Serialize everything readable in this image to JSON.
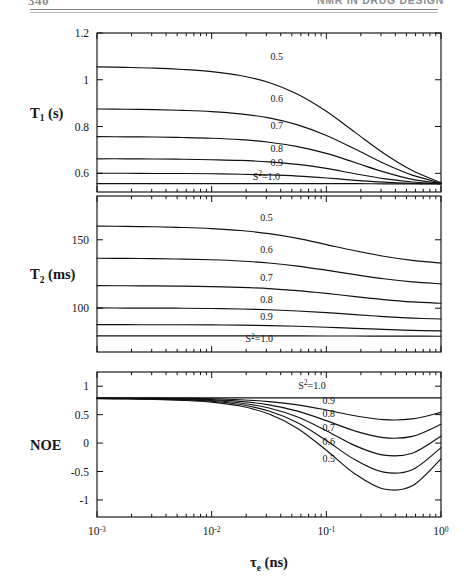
{
  "header": {
    "folio": "340",
    "running_head": "NMR IN DRUG DESIGN"
  },
  "figure": {
    "xaxis_title_main": "τ",
    "xaxis_title_sub": "e",
    "xaxis_title_unit": " (ns)",
    "xtick_labels": [
      "10-3",
      "10-2",
      "10-1",
      "100"
    ],
    "xtick_mantissa": [
      "10",
      "10",
      "10",
      "10"
    ],
    "xtick_exponent": [
      "-3",
      "-2",
      "-1",
      "0"
    ],
    "annotation_s2": "S",
    "annotation_s2_sup": "2",
    "annotation_s2_val": "=1.0"
  },
  "chart_data": [
    {
      "type": "line",
      "panel": "top",
      "ylabel": "T1 (s)",
      "ylabel_main": "T",
      "ylabel_sub": "1",
      "ylabel_unit": " (s)",
      "xlabel": "tau_e (ns)",
      "xscale": "log",
      "xlim": [
        0.001,
        1.0
      ],
      "ylim": [
        0.52,
        1.2
      ],
      "yticks": [
        1.2,
        1.0,
        0.8,
        0.6
      ],
      "ytick_labels": [
        "1.2",
        "1",
        "0.8",
        "0.6"
      ],
      "grid": false,
      "legend": "inline-curve-labels",
      "x": [
        0.001,
        0.00178,
        0.00316,
        0.00562,
        0.01,
        0.0178,
        0.0316,
        0.0562,
        0.1,
        0.178,
        0.316,
        0.562,
        1.0
      ],
      "series": [
        {
          "name": "0.5",
          "label": "0.5",
          "values": [
            1.055,
            1.053,
            1.05,
            1.044,
            1.035,
            1.018,
            0.988,
            0.938,
            0.865,
            0.775,
            0.686,
            0.612,
            0.56
          ]
        },
        {
          "name": "0.6",
          "label": "0.6",
          "values": [
            0.875,
            0.874,
            0.872,
            0.869,
            0.864,
            0.854,
            0.837,
            0.807,
            0.762,
            0.704,
            0.643,
            0.592,
            0.558
          ]
        },
        {
          "name": "0.7",
          "label": "0.7",
          "values": [
            0.757,
            0.756,
            0.755,
            0.753,
            0.75,
            0.744,
            0.733,
            0.714,
            0.685,
            0.646,
            0.606,
            0.574,
            0.557
          ]
        },
        {
          "name": "0.8",
          "label": "0.8",
          "values": [
            0.662,
            0.662,
            0.661,
            0.66,
            0.658,
            0.655,
            0.649,
            0.638,
            0.621,
            0.598,
            0.577,
            0.563,
            0.556
          ]
        },
        {
          "name": "0.9",
          "label": "0.9",
          "values": [
            0.6,
            0.6,
            0.599,
            0.599,
            0.598,
            0.596,
            0.593,
            0.588,
            0.58,
            0.57,
            0.562,
            0.557,
            0.555
          ]
        },
        {
          "name": "S2=1.0",
          "label": "S2=1.0",
          "values": [
            0.556,
            0.556,
            0.556,
            0.556,
            0.556,
            0.556,
            0.556,
            0.556,
            0.556,
            0.556,
            0.555,
            0.555,
            0.555
          ]
        }
      ],
      "curve_label_positions": [
        {
          "name": "0.5",
          "x": 0.037,
          "y": 1.085
        },
        {
          "name": "0.6",
          "x": 0.037,
          "y": 0.905
        },
        {
          "name": "0.7",
          "x": 0.037,
          "y": 0.788
        },
        {
          "name": "0.8",
          "x": 0.037,
          "y": 0.693
        },
        {
          "name": "0.9",
          "x": 0.037,
          "y": 0.631
        },
        {
          "name": "S2=1.0",
          "x": 0.03,
          "y": 0.573
        }
      ],
      "convergence_note": "all curves converge near 0.555 s at tau_e = 1 ns"
    },
    {
      "type": "line",
      "panel": "middle",
      "ylabel": "T2 (ms)",
      "ylabel_main": "T",
      "ylabel_sub": "2",
      "ylabel_unit": " (ms)",
      "xlabel": "tau_e (ns)",
      "xscale": "log",
      "xlim": [
        0.001,
        1.0
      ],
      "ylim": [
        68,
        182
      ],
      "yticks": [
        150,
        100
      ],
      "ytick_labels": [
        "150",
        "100"
      ],
      "grid": false,
      "legend": "inline-curve-labels",
      "x": [
        0.001,
        0.00178,
        0.00316,
        0.00562,
        0.01,
        0.0178,
        0.0316,
        0.0562,
        0.1,
        0.178,
        0.316,
        0.562,
        1.0
      ],
      "series": [
        {
          "name": "0.5",
          "label": "0.5",
          "values": [
            160.0,
            159.8,
            159.5,
            159.0,
            158.2,
            156.8,
            154.5,
            151.0,
            146.5,
            142.0,
            138.0,
            135.0,
            133.0
          ]
        },
        {
          "name": "0.6",
          "label": "0.6",
          "values": [
            136.5,
            136.4,
            136.2,
            135.9,
            135.4,
            134.5,
            133.0,
            130.8,
            127.8,
            124.5,
            121.5,
            119.2,
            117.8
          ]
        },
        {
          "name": "0.7",
          "label": "0.7",
          "values": [
            116.5,
            116.4,
            116.3,
            116.1,
            115.8,
            115.2,
            114.3,
            112.8,
            110.8,
            108.5,
            106.3,
            104.6,
            103.6
          ]
        },
        {
          "name": "0.8",
          "label": "0.8",
          "values": [
            100.2,
            100.1,
            100.1,
            100.0,
            99.8,
            99.4,
            98.9,
            98.0,
            96.8,
            95.3,
            93.9,
            92.8,
            92.1
          ]
        },
        {
          "name": "0.9",
          "label": "0.9",
          "values": [
            88.0,
            88.0,
            87.9,
            87.9,
            87.8,
            87.6,
            87.3,
            86.8,
            86.1,
            85.3,
            84.5,
            83.8,
            83.4
          ]
        },
        {
          "name": "S2=1.0",
          "label": "S2=1.0",
          "values": [
            79.8,
            79.8,
            79.8,
            79.8,
            79.8,
            79.8,
            79.8,
            79.8,
            79.7,
            79.7,
            79.6,
            79.6,
            79.5
          ]
        }
      ],
      "curve_label_positions": [
        {
          "name": "0.5",
          "x": 0.03,
          "y": 163.5
        },
        {
          "name": "0.6",
          "x": 0.03,
          "y": 140.0
        },
        {
          "name": "0.7",
          "x": 0.03,
          "y": 120.0
        },
        {
          "name": "0.8",
          "x": 0.03,
          "y": 103.5
        },
        {
          "name": "0.9",
          "x": 0.03,
          "y": 91.3
        },
        {
          "name": "S2=1.0",
          "x": 0.026,
          "y": 75.0
        }
      ]
    },
    {
      "type": "line",
      "panel": "bottom",
      "ylabel": "NOE",
      "xlabel": "tau_e (ns)",
      "xscale": "log",
      "xlim": [
        0.001,
        1.0
      ],
      "ylim": [
        -1.3,
        1.25
      ],
      "yticks": [
        1.0,
        0.5,
        0.0,
        -0.5,
        -1.0
      ],
      "ytick_labels": [
        "1",
        "0.5",
        "0",
        "-0.5",
        "-1"
      ],
      "grid": false,
      "legend": "inline-curve-labels",
      "x": [
        0.001,
        0.00178,
        0.00316,
        0.00562,
        0.01,
        0.0178,
        0.0316,
        0.0562,
        0.1,
        0.178,
        0.316,
        0.562,
        1.0
      ],
      "series": [
        {
          "name": "S2=1.0",
          "label": "S2=1.0",
          "values": [
            0.795,
            0.795,
            0.795,
            0.795,
            0.795,
            0.795,
            0.795,
            0.795,
            0.795,
            0.795,
            0.795,
            0.795,
            0.795
          ]
        },
        {
          "name": "0.9",
          "label": "0.9",
          "values": [
            0.793,
            0.792,
            0.79,
            0.786,
            0.779,
            0.762,
            0.73,
            0.672,
            0.582,
            0.48,
            0.412,
            0.425,
            0.54
          ]
        },
        {
          "name": "0.8",
          "label": "0.8",
          "values": [
            0.79,
            0.788,
            0.785,
            0.778,
            0.764,
            0.733,
            0.672,
            0.562,
            0.395,
            0.212,
            0.095,
            0.118,
            0.33
          ]
        },
        {
          "name": "0.7",
          "label": "0.7",
          "values": [
            0.787,
            0.784,
            0.779,
            0.769,
            0.749,
            0.705,
            0.617,
            0.458,
            0.218,
            -0.045,
            -0.212,
            -0.178,
            0.122
          ]
        },
        {
          "name": "0.6",
          "label": "0.6",
          "values": [
            0.784,
            0.78,
            0.774,
            0.761,
            0.735,
            0.678,
            0.563,
            0.357,
            0.045,
            -0.295,
            -0.512,
            -0.468,
            -0.08
          ]
        },
        {
          "name": "0.5",
          "label": "0.5",
          "values": [
            0.781,
            0.776,
            0.768,
            0.752,
            0.721,
            0.651,
            0.51,
            0.258,
            -0.125,
            -0.542,
            -0.808,
            -0.752,
            -0.278
          ]
        }
      ],
      "curve_label_positions": [
        {
          "name": "S2=1.0",
          "x": 0.075,
          "y": 0.955
        },
        {
          "name": "0.9",
          "x": 0.105,
          "y": 0.69
        },
        {
          "name": "0.8",
          "x": 0.105,
          "y": 0.455
        },
        {
          "name": "0.7",
          "x": 0.105,
          "y": 0.215
        },
        {
          "name": "0.6",
          "x": 0.105,
          "y": -0.035
        },
        {
          "name": "0.5",
          "x": 0.105,
          "y": -0.33
        }
      ],
      "dip_note": "minimum NOE deepens as S2 decreases; minima near tau_e = 0.3 ns"
    }
  ]
}
